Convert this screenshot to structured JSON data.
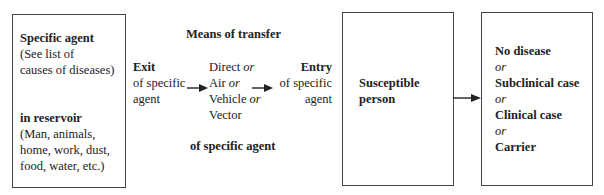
{
  "reservoir_box": {
    "title": "Specific agent",
    "note_lines": [
      "(See list of",
      "causes of diseases)"
    ],
    "subtitle": "in reservoir",
    "examples_lines": [
      "(Man, animals,",
      "home, work, dust,",
      "food, water, etc.)"
    ]
  },
  "exit": {
    "title": "Exit",
    "lines": [
      "of specific",
      "agent"
    ]
  },
  "transfer": {
    "heading": "Means of transfer",
    "footer": "of specific agent",
    "options": [
      {
        "label": "Direct",
        "connector": "or"
      },
      {
        "label": "Air",
        "connector": "or"
      },
      {
        "label": "Vehicle",
        "connector": "or"
      },
      {
        "label": "Vector",
        "connector": ""
      }
    ]
  },
  "entry": {
    "title": "Entry",
    "lines": [
      "of specific",
      "agent"
    ]
  },
  "host_box": {
    "lines": [
      "Susceptible",
      "person"
    ]
  },
  "outcome_box": {
    "outcomes": [
      "No disease",
      "Subclinical case",
      "Clinical case",
      "Carrier"
    ],
    "connector": "or"
  },
  "colors": {
    "border": "#444444",
    "text": "#222222",
    "arrow": "#222222"
  }
}
